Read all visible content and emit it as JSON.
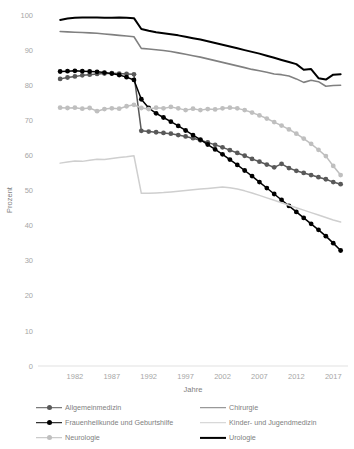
{
  "chart_data": {
    "type": "line",
    "title": "",
    "xlabel": "Jahre",
    "ylabel": "Prozent",
    "xlim": [
      1977,
      2019
    ],
    "ylim": [
      0,
      100
    ],
    "xticks": [
      "1982",
      "1987",
      "1992",
      "1997",
      "2002",
      "2007",
      "2012",
      "2017"
    ],
    "xtick_values": [
      1982,
      1987,
      1992,
      1997,
      2002,
      2007,
      2012,
      2017
    ],
    "yticks": [
      "0",
      "10",
      "20",
      "30",
      "40",
      "50",
      "60",
      "70",
      "80",
      "90",
      "100"
    ],
    "ytick_values": [
      0,
      10,
      20,
      30,
      40,
      50,
      60,
      70,
      80,
      90,
      100
    ],
    "grid": false,
    "legend_position": "bottom",
    "x": [
      1980,
      1981,
      1982,
      1983,
      1984,
      1985,
      1986,
      1987,
      1988,
      1989,
      1990,
      1991,
      1992,
      1993,
      1994,
      1995,
      1996,
      1997,
      1998,
      1999,
      2000,
      2001,
      2002,
      2003,
      2004,
      2005,
      2006,
      2007,
      2008,
      2009,
      2010,
      2011,
      2012,
      2013,
      2014,
      2015,
      2016,
      2017,
      2018
    ],
    "series": [
      {
        "name": "Allgemeinmedizin",
        "color": "#595959",
        "width": 1.5,
        "marker": true,
        "marker_size": 2.4,
        "values": [
          81.8,
          82.2,
          82.5,
          82.8,
          83.0,
          83.2,
          83.3,
          83.4,
          83.3,
          83.2,
          83.1,
          67.0,
          66.8,
          66.6,
          66.4,
          66.2,
          65.8,
          65.4,
          64.9,
          64.3,
          63.7,
          63.0,
          62.3,
          61.5,
          60.7,
          59.9,
          59.0,
          58.2,
          57.4,
          56.6,
          57.6,
          56.4,
          55.6,
          55.0,
          54.4,
          53.8,
          53.2,
          52.4,
          51.8
        ]
      },
      {
        "name": "Chirurgie",
        "color": "#808080",
        "width": 1.6,
        "marker": false,
        "values": [
          95.3,
          95.2,
          95.1,
          95.0,
          94.9,
          94.8,
          94.6,
          94.4,
          94.2,
          94.0,
          93.8,
          90.5,
          90.3,
          90.1,
          89.9,
          89.6,
          89.2,
          88.8,
          88.4,
          88.0,
          87.5,
          87.0,
          86.5,
          86.0,
          85.5,
          85.0,
          84.5,
          84.1,
          83.7,
          83.2,
          83.0,
          82.6,
          81.8,
          80.8,
          81.4,
          81.0,
          79.7,
          79.9,
          80.0
        ]
      },
      {
        "name": "Frauenheilkunde und Geburtshilfe",
        "color": "#000000",
        "width": 1.5,
        "marker": true,
        "marker_size": 2.4,
        "values": [
          83.9,
          84.0,
          84.1,
          84.0,
          83.9,
          83.8,
          83.6,
          83.3,
          82.9,
          82.3,
          81.5,
          76.0,
          73.5,
          72.0,
          70.8,
          69.6,
          68.4,
          67.1,
          65.8,
          64.5,
          63.1,
          61.7,
          60.3,
          58.8,
          57.3,
          55.7,
          54.1,
          52.4,
          50.7,
          49.0,
          47.3,
          45.6,
          43.9,
          42.2,
          40.5,
          38.8,
          37.0,
          35.0,
          32.9
        ]
      },
      {
        "name": "Kinder- und Jugendmedizin",
        "color": "#cfcfcf",
        "width": 1.5,
        "marker": false,
        "values": [
          57.8,
          58.1,
          58.4,
          58.3,
          58.6,
          58.9,
          58.8,
          59.1,
          59.4,
          59.6,
          59.9,
          49.2,
          49.2,
          49.3,
          49.4,
          49.6,
          49.8,
          50.0,
          50.2,
          50.4,
          50.6,
          50.8,
          51.0,
          50.8,
          50.4,
          49.9,
          49.3,
          48.6,
          47.9,
          47.2,
          46.5,
          45.8,
          45.1,
          44.4,
          43.7,
          43.0,
          42.3,
          41.6,
          41.0
        ]
      },
      {
        "name": "Neurologie",
        "color": "#bfbfbf",
        "width": 1.5,
        "marker": true,
        "marker_size": 2.4,
        "values": [
          73.6,
          73.5,
          73.6,
          73.3,
          73.5,
          72.6,
          73.2,
          73.4,
          73.3,
          74.0,
          74.4,
          73.5,
          73.2,
          73.6,
          73.4,
          73.8,
          73.4,
          72.9,
          73.3,
          72.9,
          73.2,
          73.1,
          73.4,
          73.6,
          73.4,
          72.9,
          72.2,
          71.4,
          70.5,
          69.5,
          68.5,
          67.4,
          66.2,
          64.8,
          63.3,
          61.6,
          59.8,
          57.0,
          54.4
        ]
      },
      {
        "name": "Urologie",
        "color": "#000000",
        "width": 2.0,
        "marker": false,
        "values": [
          98.6,
          99.0,
          99.2,
          99.3,
          99.3,
          99.3,
          99.2,
          99.2,
          99.3,
          99.2,
          99.1,
          96.0,
          95.5,
          95.1,
          94.8,
          94.5,
          94.2,
          93.8,
          93.4,
          93.0,
          92.5,
          92.0,
          91.5,
          91.0,
          90.5,
          90.0,
          89.5,
          89.0,
          88.4,
          87.8,
          87.2,
          86.6,
          86.0,
          84.4,
          84.6,
          82.0,
          81.6,
          83.0,
          83.1
        ]
      }
    ]
  },
  "legend": {
    "columns": [
      {
        "items": [
          {
            "label": "Allgemeinmedizin",
            "color": "#595959",
            "marker": true,
            "thick": false
          },
          {
            "label": "Frauenheilkunde und Geburtshilfe",
            "color": "#000000",
            "marker": true,
            "thick": false
          },
          {
            "label": "Neurologie",
            "color": "#bfbfbf",
            "marker": true,
            "thick": false
          }
        ]
      },
      {
        "items": [
          {
            "label": "Chirurgie",
            "color": "#808080",
            "marker": false,
            "thick": false
          },
          {
            "label": "Kinder- und Jugendmedizin",
            "color": "#cfcfcf",
            "marker": false,
            "thick": false
          },
          {
            "label": "Urologie",
            "color": "#000000",
            "marker": false,
            "thick": true
          }
        ]
      }
    ]
  }
}
